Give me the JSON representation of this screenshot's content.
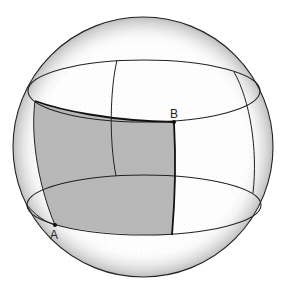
{
  "figure": {
    "colors": {
      "outline": "#222222",
      "shaded_region": "#b8b8b8",
      "stipple": "#9a9a9a",
      "background": "#ffffff"
    },
    "points": [
      {
        "id": "A",
        "label": "A",
        "x": 55,
        "y": 225
      },
      {
        "id": "B",
        "label": "B",
        "x": 174,
        "y": 122
      }
    ]
  }
}
